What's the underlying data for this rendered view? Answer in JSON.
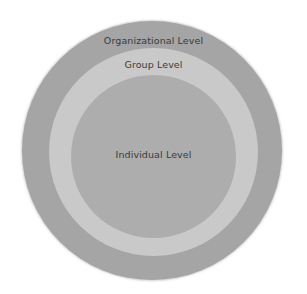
{
  "diagram": {
    "type": "concentric-circles",
    "levels": [
      {
        "label": "Organizational Level",
        "color": "#a5a5a5"
      },
      {
        "label": "Group Level",
        "color": "#c9c9c9"
      },
      {
        "label": "Individual Level",
        "color": "#adadad"
      }
    ],
    "text_color": "#3a3a3a",
    "background": "#ffffff"
  }
}
